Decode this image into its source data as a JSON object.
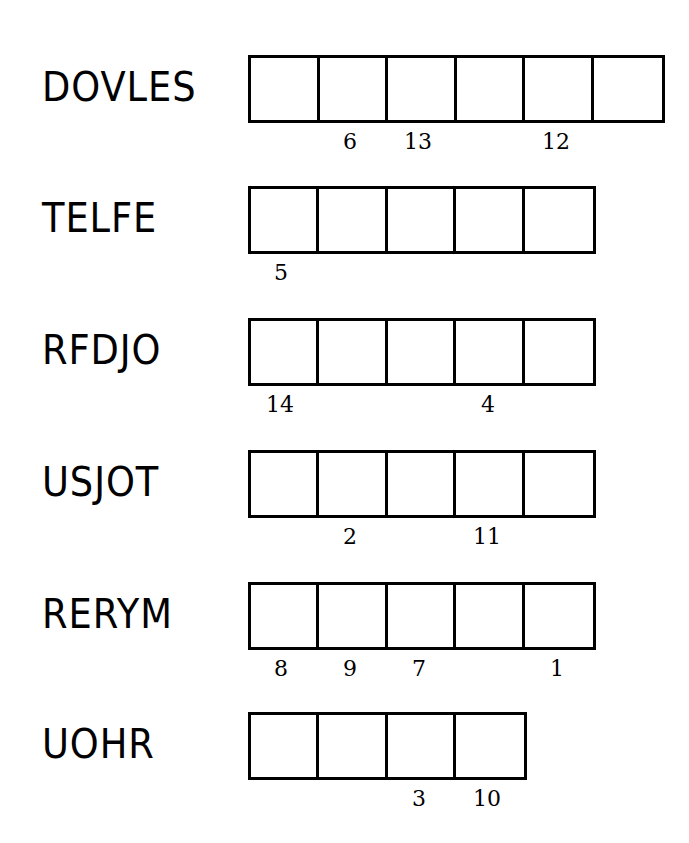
{
  "puzzle": {
    "rows": [
      {
        "word": "DOVLES",
        "cells": 6,
        "clues": [
          {
            "cell": 2,
            "num": "6"
          },
          {
            "cell": 3,
            "num": "13"
          },
          {
            "cell": 5,
            "num": "12"
          }
        ]
      },
      {
        "word": "TELFE",
        "cells": 5,
        "clues": [
          {
            "cell": 1,
            "num": "5"
          }
        ]
      },
      {
        "word": "RFDJO",
        "cells": 5,
        "clues": [
          {
            "cell": 1,
            "num": "14"
          },
          {
            "cell": 4,
            "num": "4"
          }
        ]
      },
      {
        "word": "USJOT",
        "cells": 5,
        "clues": [
          {
            "cell": 2,
            "num": "2"
          },
          {
            "cell": 4,
            "num": "11"
          }
        ]
      },
      {
        "word": "RERYM",
        "cells": 5,
        "clues": [
          {
            "cell": 1,
            "num": "8"
          },
          {
            "cell": 2,
            "num": "9"
          },
          {
            "cell": 3,
            "num": "7"
          },
          {
            "cell": 5,
            "num": "1"
          }
        ]
      },
      {
        "word": "UOHR",
        "cells": 4,
        "clues": [
          {
            "cell": 3,
            "num": "3"
          },
          {
            "cell": 4,
            "num": "10"
          }
        ]
      }
    ]
  },
  "layout": {
    "row_tops": [
      55,
      186,
      318,
      450,
      582,
      712
    ]
  }
}
